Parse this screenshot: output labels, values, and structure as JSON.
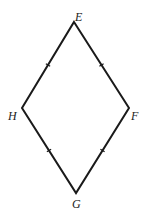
{
  "diagram": {
    "type": "rhombus",
    "vertices": [
      {
        "label": "E",
        "x": 74,
        "y": 22,
        "label_x": 75,
        "label_y": 21
      },
      {
        "label": "F",
        "x": 129,
        "y": 108,
        "label_x": 131,
        "label_y": 120
      },
      {
        "label": "G",
        "x": 76,
        "y": 193,
        "label_x": 72,
        "label_y": 208
      },
      {
        "label": "H",
        "x": 22,
        "y": 108,
        "label_x": 8,
        "label_y": 120
      }
    ],
    "edges": [
      {
        "from": "E",
        "to": "F",
        "tick_marks": 1
      },
      {
        "from": "F",
        "to": "G",
        "tick_marks": 1
      },
      {
        "from": "G",
        "to": "H",
        "tick_marks": 1
      },
      {
        "from": "H",
        "to": "E",
        "tick_marks": 1
      }
    ],
    "colors": {
      "line": "#1a1a1a",
      "label": "#222222",
      "background": "#ffffff"
    }
  }
}
